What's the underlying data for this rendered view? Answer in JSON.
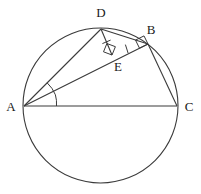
{
  "figure": {
    "background_color": "#ffffff",
    "stroke_color": "#3a3a3a",
    "label_color": "#1a1a1a",
    "circle": {
      "name": "circumcircle",
      "center_x": 100.5,
      "center_y": 105.5,
      "radius": 77.5
    },
    "points": [
      {
        "id": "A",
        "label": "A",
        "x": 24,
        "y": 106,
        "label_x": 11,
        "label_y": 108
      },
      {
        "id": "B",
        "label": "B",
        "x": 148,
        "y": 44,
        "label_x": 151,
        "label_y": 31
      },
      {
        "id": "C",
        "label": "C",
        "x": 177,
        "y": 106,
        "label_x": 189,
        "label_y": 108
      },
      {
        "id": "D",
        "label": "D",
        "x": 101,
        "y": 29,
        "label_x": 101,
        "label_y": 14
      },
      {
        "id": "E",
        "label": "E",
        "x": 112,
        "y": 55,
        "label_x": 118,
        "label_y": 68
      }
    ],
    "segments": [
      {
        "id": "AC",
        "from": "A",
        "to": "C"
      },
      {
        "id": "AD",
        "from": "A",
        "to": "D"
      },
      {
        "id": "AB",
        "from": "A",
        "to": "B"
      },
      {
        "id": "DE",
        "from": "D",
        "to": "E"
      },
      {
        "id": "BC",
        "from": "B",
        "to": "C"
      },
      {
        "id": "DB",
        "from": "D",
        "to": "B"
      }
    ],
    "right_angles": [
      {
        "id": "right-angle-at-E",
        "at": "E",
        "size": 9
      },
      {
        "id": "right-angle-at-B",
        "at": "B",
        "size": 9
      }
    ],
    "tick_marks": [
      {
        "id": "tick-DE",
        "on_segment": "DE",
        "count": 1
      },
      {
        "id": "tick-EB",
        "on_segment": "EB",
        "count": 1
      }
    ],
    "angle_marks": [
      {
        "id": "angle-DAE",
        "vertex": "A",
        "arcs": 1
      },
      {
        "id": "angle-EAC",
        "vertex": "A",
        "arcs": 1
      }
    ]
  }
}
